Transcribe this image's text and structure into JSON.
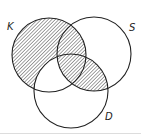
{
  "diagram": {
    "type": "venn",
    "sets": [
      {
        "name": "K",
        "cx": 49,
        "cy": 55,
        "r": 37
      },
      {
        "name": "S",
        "cx": 94,
        "cy": 54,
        "r": 37
      },
      {
        "name": "D",
        "cx": 71,
        "cy": 91,
        "r": 37
      }
    ],
    "labels": {
      "k": "K",
      "s": "S",
      "d": "D"
    },
    "shaded_regions": [
      "K only",
      "K∩S not D",
      "K∩S∩D",
      "S∩D not K"
    ],
    "unshaded_regions": [
      "S only",
      "D only",
      "K∩D not S"
    ],
    "colors": {
      "stroke": "#222222",
      "hatch": "#555555"
    }
  }
}
